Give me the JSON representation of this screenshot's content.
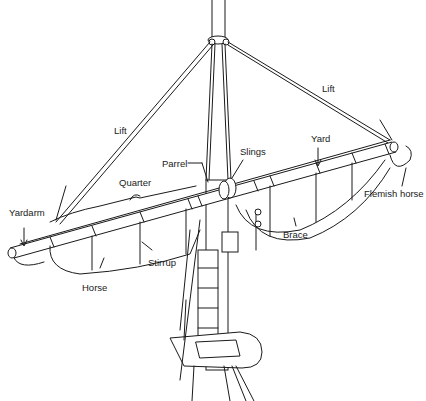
{
  "diagram": {
    "colors": {
      "ink": "#1a1a1a",
      "background": "#ffffff"
    },
    "labels": [
      {
        "id": "lift-left",
        "text": "Lift"
      },
      {
        "id": "lift-right",
        "text": "Lift"
      },
      {
        "id": "parrel",
        "text": "Parrel"
      },
      {
        "id": "slings",
        "text": "Slings"
      },
      {
        "id": "yard",
        "text": "Yard"
      },
      {
        "id": "quarter",
        "text": "Quarter"
      },
      {
        "id": "yardarm",
        "text": "Yardarm"
      },
      {
        "id": "flemish-horse",
        "text": "Flemish horse"
      },
      {
        "id": "brace",
        "text": "Brace"
      },
      {
        "id": "stirrup",
        "text": "Stirrup"
      },
      {
        "id": "horse",
        "text": "Horse"
      }
    ]
  }
}
